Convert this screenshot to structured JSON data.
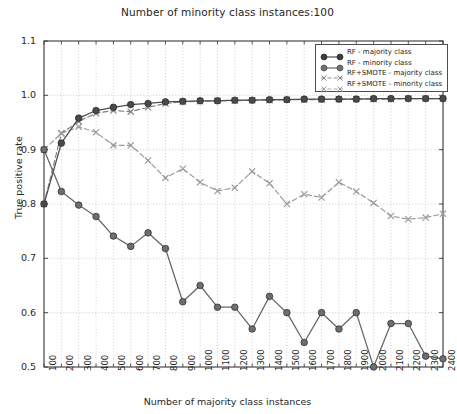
{
  "chart_data": {
    "type": "line",
    "title": "Number of minority class instances:100",
    "xlabel": "Number of majority class instances",
    "ylabel": "True positive rate",
    "xlim": [
      100,
      2400
    ],
    "ylim": [
      0.5,
      1.1
    ],
    "grid": true,
    "legend_position": "upper right",
    "x": [
      100,
      200,
      300,
      400,
      500,
      600,
      700,
      800,
      900,
      1000,
      1100,
      1200,
      1300,
      1400,
      1500,
      1600,
      1700,
      1800,
      1900,
      2000,
      2100,
      2200,
      2300,
      2400
    ],
    "xticks": [
      "100",
      "200",
      "300",
      "400",
      "500",
      "600",
      "700",
      "800",
      "900",
      "1000",
      "1100",
      "1200",
      "1300",
      "1400",
      "1500",
      "1600",
      "1700",
      "1800",
      "1900",
      "2000",
      "2100",
      "2200",
      "2300",
      "2400"
    ],
    "yticks": [
      "0.5",
      "0.6",
      "0.7",
      "0.8",
      "0.9",
      "1.0",
      "1.1"
    ],
    "ytick_values": [
      0.5,
      0.6,
      0.7,
      0.8,
      0.9,
      1.0,
      1.1
    ],
    "series": [
      {
        "name": "RF - majority class",
        "color": "#4d4d4d",
        "marker": "circle-filled",
        "linestyle": "solid",
        "values": [
          0.8,
          0.912,
          0.958,
          0.972,
          0.978,
          0.983,
          0.985,
          0.988,
          0.989,
          0.99,
          0.99,
          0.991,
          0.991,
          0.992,
          0.992,
          0.993,
          0.993,
          0.993,
          0.993,
          0.994,
          0.994,
          0.994,
          0.994,
          0.994
        ]
      },
      {
        "name": "RF - minority class",
        "color": "#666666",
        "marker": "circle-filled",
        "linestyle": "solid",
        "values": [
          0.9,
          0.823,
          0.798,
          0.777,
          0.741,
          0.722,
          0.747,
          0.718,
          0.62,
          0.65,
          0.61,
          0.61,
          0.57,
          0.63,
          0.6,
          0.545,
          0.6,
          0.57,
          0.6,
          0.5,
          0.58,
          0.58,
          0.52,
          0.515
        ]
      },
      {
        "name": "RF+SMOTE - majority class",
        "color": "#808080",
        "marker": "x",
        "linestyle": "dashed",
        "values": [
          0.8,
          0.93,
          0.952,
          0.967,
          0.972,
          0.97,
          0.978,
          0.985,
          0.988,
          0.989,
          0.99,
          0.99,
          0.991,
          0.991,
          0.992,
          0.992,
          0.992,
          0.993,
          0.993,
          0.993,
          0.993,
          0.994,
          0.994,
          0.994
        ]
      },
      {
        "name": "RF+SMOTE - minority class",
        "color": "#999999",
        "marker": "x",
        "linestyle": "dashed",
        "values": [
          0.9,
          0.93,
          0.942,
          0.932,
          0.908,
          0.908,
          0.88,
          0.848,
          0.865,
          0.84,
          0.824,
          0.83,
          0.86,
          0.838,
          0.8,
          0.818,
          0.812,
          0.84,
          0.823,
          0.802,
          0.778,
          0.772,
          0.775,
          0.782
        ]
      }
    ]
  },
  "legend": {
    "items": [
      {
        "label": "RF - majority class"
      },
      {
        "label": "RF - minority class"
      },
      {
        "label": "RF+SMOTE - majority class"
      },
      {
        "label": "RF+SMOTE - minority class"
      }
    ]
  }
}
